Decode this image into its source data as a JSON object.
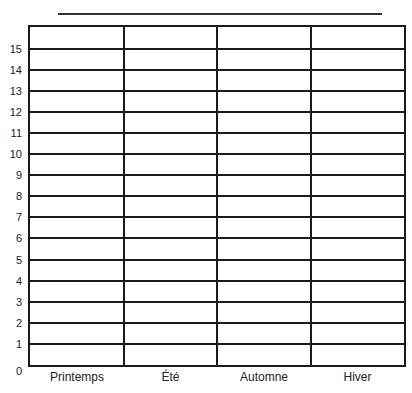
{
  "chart_data": {
    "type": "bar",
    "title": "",
    "xlabel": "",
    "ylabel": "",
    "categories": [
      "Printemps",
      "Été",
      "Automne",
      "Hiver"
    ],
    "values": [
      null,
      null,
      null,
      null
    ],
    "ylim": [
      0,
      16
    ],
    "yticks": [
      0,
      1,
      2,
      3,
      4,
      5,
      6,
      7,
      8,
      9,
      10,
      11,
      12,
      13,
      14,
      15
    ],
    "grid": true,
    "note": "Blank grid template; title line empty"
  },
  "labels": {
    "y": [
      "0",
      "1",
      "2",
      "3",
      "4",
      "5",
      "6",
      "7",
      "8",
      "9",
      "10",
      "11",
      "12",
      "13",
      "14",
      "15"
    ],
    "x": [
      "Printemps",
      "Été",
      "Automne",
      "Hiver"
    ]
  },
  "colors": {
    "line": "#1a1a1a",
    "background": "#ffffff"
  }
}
